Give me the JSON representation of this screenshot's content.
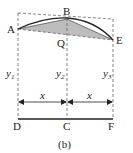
{
  "diagram": {
    "caption": "(b)",
    "points": {
      "A": "A",
      "B": "B",
      "E": "E",
      "Q": "Q",
      "D": "D",
      "C": "C",
      "F": "F"
    },
    "heights": {
      "y1": "y",
      "y1_sub": "1",
      "y2": "y",
      "y2_sub": "2",
      "y3": "y",
      "y3_sub": "3"
    },
    "widths": {
      "left": "x",
      "right": "x"
    },
    "colors": {
      "line": "#222222",
      "dashed": "#666666",
      "shaded": "#bdbdbd"
    }
  }
}
